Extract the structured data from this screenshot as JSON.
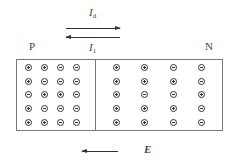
{
  "labels": {
    "p_region": "P",
    "n_region": "N",
    "diffusion_current": "I",
    "diffusion_sub": "d",
    "drift_current": "I",
    "drift_sub": "1",
    "field": "E"
  },
  "p_side": [
    [
      "+",
      "+",
      "-",
      "-"
    ],
    [
      "+",
      "-",
      "-",
      "-"
    ],
    [
      "-",
      "+",
      "+",
      "-"
    ],
    [
      "+",
      "-",
      "-",
      "-"
    ],
    [
      "+",
      "+",
      "-",
      "-"
    ]
  ],
  "n_side": [
    [
      "+",
      "+",
      "-",
      "-"
    ],
    [
      "+",
      "+",
      "+",
      "-"
    ],
    [
      "+",
      "-",
      "-",
      "+"
    ],
    [
      "+",
      "+",
      "+",
      "-"
    ],
    [
      "+",
      "+",
      "-",
      "-"
    ]
  ]
}
